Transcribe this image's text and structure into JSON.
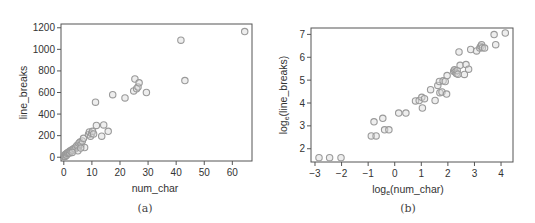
{
  "figure": {
    "panels": [
      {
        "id": "a",
        "caption": "(a)"
      },
      {
        "id": "b",
        "caption": "(b)"
      }
    ]
  },
  "chart_data": [
    {
      "id": "a",
      "type": "scatter",
      "title": "",
      "caption": "(a)",
      "xlabel": "num_char",
      "ylabel": "line_breaks",
      "xlim": [
        -1,
        67
      ],
      "ylim": [
        -35,
        1235
      ],
      "xticks": [
        0,
        10,
        20,
        30,
        40,
        50,
        60
      ],
      "yticks": [
        0,
        200,
        400,
        600,
        800,
        1000,
        1200
      ],
      "grid": false,
      "legend": null,
      "marker": {
        "shape": "open-circle",
        "color": "#9a9a9a",
        "fill": "#d9d9d9"
      },
      "points": [
        [
          0.1,
          5
        ],
        [
          0.2,
          12
        ],
        [
          0.4,
          20
        ],
        [
          0.5,
          8
        ],
        [
          0.6,
          25
        ],
        [
          0.8,
          30
        ],
        [
          1.0,
          18
        ],
        [
          1.2,
          40
        ],
        [
          1.4,
          35
        ],
        [
          1.6,
          45
        ],
        [
          1.9,
          50
        ],
        [
          2.1,
          38
        ],
        [
          2.3,
          60
        ],
        [
          2.6,
          55
        ],
        [
          2.9,
          70
        ],
        [
          3.2,
          65
        ],
        [
          3.6,
          80
        ],
        [
          4.0,
          75
        ],
        [
          4.3,
          95
        ],
        [
          4.7,
          110
        ],
        [
          5.1,
          100
        ],
        [
          5.4,
          130
        ],
        [
          5.8,
          140
        ],
        [
          6.2,
          120
        ],
        [
          6.6,
          150
        ],
        [
          7.0,
          175
        ],
        [
          7.4,
          90
        ],
        [
          5.0,
          60
        ],
        [
          3.0,
          45
        ],
        [
          6.0,
          85
        ],
        [
          8.8,
          210
        ],
        [
          9.1,
          235
        ],
        [
          9.5,
          195
        ],
        [
          9.9,
          220
        ],
        [
          10.2,
          240
        ],
        [
          10.6,
          215
        ],
        [
          11.3,
          510
        ],
        [
          11.6,
          295
        ],
        [
          13.5,
          195
        ],
        [
          14.2,
          300
        ],
        [
          15.8,
          240
        ],
        [
          17.4,
          580
        ],
        [
          21.8,
          550
        ],
        [
          24.9,
          615
        ],
        [
          25.3,
          725
        ],
        [
          25.9,
          635
        ],
        [
          26.4,
          650
        ],
        [
          26.8,
          690
        ],
        [
          29.4,
          600
        ],
        [
          41.7,
          1085
        ],
        [
          43.1,
          710
        ],
        [
          64.4,
          1165
        ]
      ]
    },
    {
      "id": "b",
      "type": "scatter",
      "title": "",
      "caption": "(b)",
      "xlabel": "loge(num_char)",
      "xlabel_base": "log",
      "xlabel_sub": "e",
      "xlabel_rest": "(num_char)",
      "ylabel": "loge(line_breaks)",
      "ylabel_base": "log",
      "ylabel_sub": "e",
      "ylabel_rest": "(line_breaks)",
      "xlim": [
        -3.15,
        4.45
      ],
      "ylim": [
        1.42,
        7.28
      ],
      "xticks": [
        -3,
        -2,
        -1,
        0,
        1,
        2,
        3,
        4
      ],
      "yticks": [
        2,
        3,
        4,
        5,
        6,
        7
      ],
      "grid": false,
      "legend": null,
      "marker": {
        "shape": "open-circle",
        "color": "#9a9a9a",
        "fill": "#d9d9d9"
      },
      "points": [
        [
          -2.85,
          1.61
        ],
        [
          -2.45,
          1.61
        ],
        [
          -2.02,
          1.61
        ],
        [
          -0.88,
          2.56
        ],
        [
          -0.7,
          2.56
        ],
        [
          -0.78,
          3.18
        ],
        [
          -0.45,
          3.33
        ],
        [
          -0.38,
          2.83
        ],
        [
          -0.22,
          2.83
        ],
        [
          0.15,
          3.56
        ],
        [
          0.42,
          3.56
        ],
        [
          0.78,
          4.09
        ],
        [
          0.92,
          4.11
        ],
        [
          1.02,
          4.25
        ],
        [
          1.12,
          4.19
        ],
        [
          1.04,
          3.78
        ],
        [
          1.35,
          4.58
        ],
        [
          1.52,
          4.11
        ],
        [
          1.62,
          4.77
        ],
        [
          1.68,
          4.94
        ],
        [
          1.7,
          4.45
        ],
        [
          1.78,
          4.48
        ],
        [
          1.82,
          4.97
        ],
        [
          1.9,
          4.94
        ],
        [
          1.95,
          4.39
        ],
        [
          1.97,
          5.2
        ],
        [
          2.22,
          5.39
        ],
        [
          2.25,
          5.45
        ],
        [
          2.28,
          5.35
        ],
        [
          2.32,
          5.29
        ],
        [
          2.35,
          5.42
        ],
        [
          2.38,
          5.26
        ],
        [
          2.42,
          6.23
        ],
        [
          2.46,
          5.65
        ],
        [
          2.62,
          5.25
        ],
        [
          2.68,
          5.68
        ],
        [
          2.78,
          5.48
        ],
        [
          2.86,
          6.34
        ],
        [
          3.08,
          6.28
        ],
        [
          3.2,
          6.4
        ],
        [
          3.24,
          6.48
        ],
        [
          3.27,
          6.55
        ],
        [
          3.3,
          6.42
        ],
        [
          3.38,
          6.4
        ],
        [
          3.74,
          6.99
        ],
        [
          3.8,
          6.55
        ],
        [
          4.16,
          7.06
        ]
      ]
    }
  ]
}
